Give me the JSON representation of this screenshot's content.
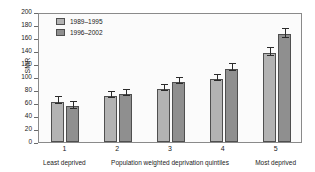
{
  "chart_data": {
    "type": "bar",
    "title": "",
    "xlabel": "Population weighted deprivation quintiles",
    "ylabel": "SMR",
    "ylim": [
      0,
      200
    ],
    "ytick_step": 20,
    "yticks": [
      0,
      20,
      40,
      60,
      80,
      100,
      120,
      140,
      160,
      180,
      200
    ],
    "categories": [
      "1",
      "2",
      "3",
      "4",
      "5"
    ],
    "grid": false,
    "legend_position": "top-left",
    "series": [
      {
        "name": "1989–1995",
        "color": "#b3b3b3",
        "values": [
          62,
          71,
          81,
          97,
          137
        ],
        "errors": [
          5,
          4.5,
          4.5,
          5,
          6
        ]
      },
      {
        "name": "1996–2002",
        "color": "#8f8f8f",
        "values": [
          55,
          74,
          92,
          113,
          166
        ],
        "errors": [
          5,
          4.5,
          5,
          5,
          7
        ]
      }
    ],
    "annotations": [
      {
        "text": "Least deprived",
        "at_category": "1"
      },
      {
        "text": "Population weighted deprivation quintiles",
        "at_category": "3"
      },
      {
        "text": "Most deprived",
        "at_category": "5"
      }
    ]
  },
  "axis": {
    "y_title": "SMR",
    "y_tick_labels": [
      "200",
      "180",
      "160",
      "140",
      "120",
      "100",
      "80",
      "60",
      "40",
      "20",
      "0"
    ],
    "x_tick_labels": [
      "1",
      "2",
      "3",
      "4",
      "5"
    ]
  },
  "legend": {
    "items": [
      {
        "label": "1989–1995"
      },
      {
        "label": "1996–2002"
      }
    ]
  },
  "notes": {
    "left": "Least deprived",
    "center": "Population weighted deprivation quintiles",
    "right": "Most deprived"
  }
}
